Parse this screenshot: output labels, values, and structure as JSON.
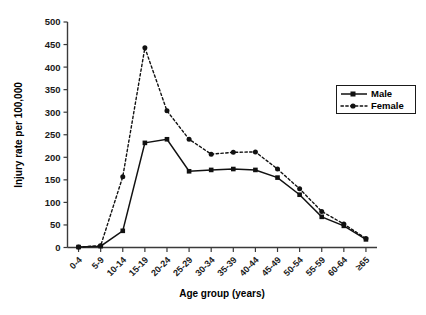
{
  "chart_data": {
    "type": "line",
    "title": "",
    "xlabel": "Age group (years)",
    "ylabel": "Injury rate per 100,000",
    "categories": [
      "0-4",
      "5-9",
      "10-14",
      "15-19",
      "20-24",
      "25-29",
      "30-34",
      "35-39",
      "40-44",
      "45-49",
      "50-54",
      "55-59",
      "60-64",
      "≥65"
    ],
    "ylim": [
      0,
      500
    ],
    "yticks": [
      0,
      50,
      100,
      150,
      200,
      250,
      300,
      350,
      400,
      450,
      500
    ],
    "ytick_labels": [
      "0",
      "50",
      "100",
      "150",
      "200",
      "250",
      "300",
      "350",
      "400",
      "450",
      "500"
    ],
    "grid": false,
    "legend_position": "right-upper",
    "series": [
      {
        "name": "Male",
        "line_style": "solid",
        "marker": "square",
        "color": "#111111",
        "values": [
          1,
          3,
          37,
          232,
          240,
          169,
          172,
          174,
          172,
          155,
          117,
          68,
          48,
          18
        ]
      },
      {
        "name": "Female",
        "line_style": "dotted",
        "marker": "circle",
        "color": "#111111",
        "values": [
          1,
          4,
          157,
          443,
          303,
          240,
          207,
          211,
          212,
          174,
          130,
          80,
          52,
          20
        ]
      }
    ]
  },
  "legend": {
    "entries": [
      {
        "label": "Male"
      },
      {
        "label": "Female"
      }
    ]
  }
}
